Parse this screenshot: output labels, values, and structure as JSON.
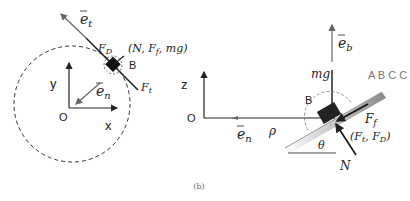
{
  "caption": "(b)",
  "left_panel": {
    "axes": {
      "x_label": "x",
      "y_label": "y",
      "origin_label": "O"
    },
    "vectors": {
      "tangent": "e",
      "tangent_sub": "t",
      "normal": "e",
      "normal_sub": "n"
    },
    "body_label": "B",
    "forces": {
      "drag": "F",
      "drag_sub": "D",
      "thrust": "F",
      "thrust_sub": "t",
      "out_of_plane": "(N, F",
      "out_of_plane_sub": "f",
      "out_of_plane_tail": ", mg)"
    }
  },
  "right_panel": {
    "axes": {
      "z_label": "z",
      "origin_label": "O"
    },
    "vectors": {
      "binormal": "e",
      "binormal_sub": "b",
      "normal": "e",
      "normal_sub": "n"
    },
    "radius_label": "ρ",
    "body_label": "B",
    "gravity_label": "mg",
    "angle_label": "θ",
    "normal_force_label": "N",
    "friction_label": "F",
    "friction_sub": "f",
    "in_plane_forces": "(F",
    "in_plane_forces_sub1": "t",
    "in_plane_forces_mid": ", F",
    "in_plane_forces_sub2": "D",
    "in_plane_forces_tail": ")",
    "watermark": "A B C C"
  }
}
